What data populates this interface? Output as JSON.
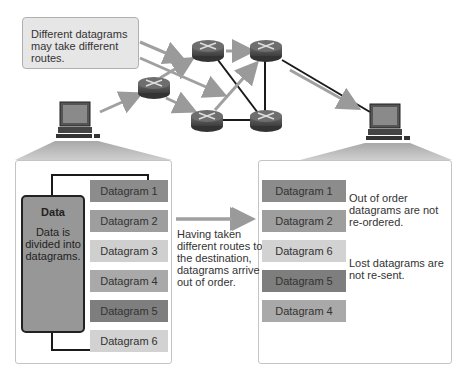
{
  "callout": {
    "text": "Different datagrams may take different routes."
  },
  "network": {
    "routers": [
      {
        "id": "r1"
      },
      {
        "id": "r2"
      },
      {
        "id": "r3"
      },
      {
        "id": "r4"
      },
      {
        "id": "r5"
      }
    ],
    "computers": [
      {
        "id": "source-computer"
      },
      {
        "id": "destination-computer"
      }
    ]
  },
  "source": {
    "data_title": "Data",
    "data_desc": "Data is divided into datagrams.",
    "datagrams": [
      {
        "label": "Datagram 1",
        "shade": "c1"
      },
      {
        "label": "Datagram 2",
        "shade": "c2"
      },
      {
        "label": "Datagram 3",
        "shade": "c3"
      },
      {
        "label": "Datagram 4",
        "shade": "c4"
      },
      {
        "label": "Datagram 5",
        "shade": "c5"
      },
      {
        "label": "Datagram 6",
        "shade": "c6"
      }
    ]
  },
  "transit_text": "Having taken different routes to the destination, datagrams arrive out of order.",
  "destination": {
    "datagrams": [
      {
        "label": "Datagram 1",
        "shade": "c1"
      },
      {
        "label": "Datagram 2",
        "shade": "c2"
      },
      {
        "label": "Datagram 6",
        "shade": "c6"
      },
      {
        "label": "Datagram 5",
        "shade": "c5"
      },
      {
        "label": "Datagram 4",
        "shade": "c4"
      }
    ],
    "note_order": "Out of order datagrams are not re-ordered.",
    "note_lost": "Lost datagrams are not re-sent."
  }
}
